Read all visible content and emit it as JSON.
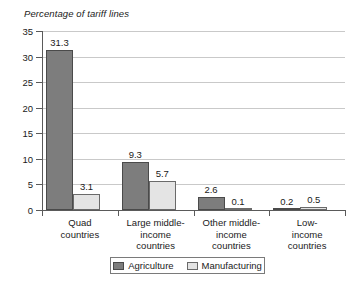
{
  "chart_data": {
    "type": "bar",
    "title": "Percentage of tariff lines",
    "xlabel": "",
    "ylabel": "",
    "ylim": [
      0,
      35
    ],
    "yticks": [
      "0",
      "5",
      "10",
      "15",
      "20",
      "25",
      "30",
      "35"
    ],
    "grid": true,
    "legend_position": "bottom",
    "categories": [
      "Quad\ncountries",
      "Large middle-\nincome\ncountries",
      "Other middle-\nincome\ncountries",
      "Low-income\ncountries"
    ],
    "series": [
      {
        "name": "Agriculture",
        "color": "#7d7d7d",
        "values": [
          31.3,
          9.3,
          2.6,
          0.2
        ],
        "labels": [
          "31.3",
          "9.3",
          "2.6",
          "0.2"
        ]
      },
      {
        "name": "Manufacturing",
        "color": "#e4e4e4",
        "values": [
          3.1,
          5.7,
          0.1,
          0.5
        ],
        "labels": [
          "3.1",
          "5.7",
          "0.1",
          "0.5"
        ]
      }
    ]
  },
  "legend": {
    "items": [
      {
        "label": "Agriculture"
      },
      {
        "label": "Manufacturing"
      }
    ]
  }
}
